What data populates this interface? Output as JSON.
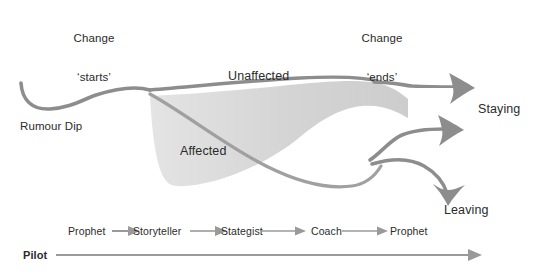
{
  "diagram": {
    "colors": {
      "line": "#8d8d8d",
      "line_dark": "#6f6f6f",
      "fill": "#d3d3d3",
      "text": "#2b2b2b",
      "axis": "#9a9a9a"
    },
    "markers": [
      {
        "id": "change-starts",
        "line1": "Change",
        "line2": "‘starts’",
        "x": 93
      },
      {
        "id": "change-ends",
        "line1": "Change",
        "line2": "‘ends’",
        "x": 381
      }
    ],
    "curve_labels": [
      {
        "id": "rumour-dip",
        "text": "Rumour Dip"
      },
      {
        "id": "unaffected",
        "text": "Unaffected"
      },
      {
        "id": "affected",
        "text": "Affected"
      },
      {
        "id": "staying",
        "text": "Staying"
      },
      {
        "id": "leaving",
        "text": "Leaving"
      }
    ],
    "roles": {
      "track_label": "Pilot",
      "sequence": [
        "Prophet",
        "Storyteller",
        "Stategist",
        "Coach",
        "Prophet"
      ]
    }
  }
}
